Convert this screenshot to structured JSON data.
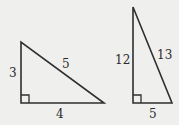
{
  "diagram": {
    "colors": {
      "background": "#efefee",
      "stroke": "#2f2f2f",
      "text": "#2a2a2a"
    },
    "triangles": [
      {
        "id": "triangle-3-4-5",
        "right_angle": true,
        "sides": {
          "vertical": "3",
          "horizontal": "4",
          "hypotenuse": "5"
        }
      },
      {
        "id": "triangle-5-12-13",
        "right_angle": true,
        "sides": {
          "vertical": "12",
          "horizontal": "5",
          "hypotenuse": "13"
        }
      }
    ]
  }
}
